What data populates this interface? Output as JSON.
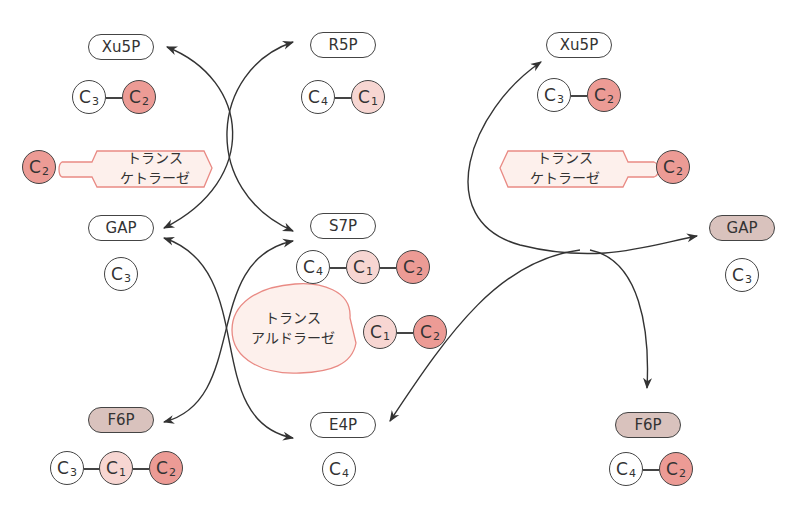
{
  "colors": {
    "line": "#333333",
    "c1_fill": "#f7d6d2",
    "c2_fill": "#ec9b95",
    "enzyme_fill": "#fdf0ec",
    "enzyme_stroke": "#e98a84",
    "shaded_pill": "#d9c2bd"
  },
  "left": {
    "xu5p": {
      "label": "Xu5P",
      "carbons": [
        {
          "c": "C",
          "n": "3"
        },
        {
          "c": "C",
          "n": "2"
        }
      ]
    },
    "r5p": {
      "label": "R5P",
      "carbons": [
        {
          "c": "C",
          "n": "4"
        },
        {
          "c": "C",
          "n": "1"
        }
      ]
    },
    "transketolase": {
      "line1": "トランス",
      "line2": "ケトラーゼ",
      "carried": {
        "c": "C",
        "n": "2"
      }
    },
    "gap": {
      "label": "GAP",
      "carbons": [
        {
          "c": "C",
          "n": "3"
        }
      ]
    },
    "s7p": {
      "label": "S7P",
      "carbons": [
        {
          "c": "C",
          "n": "4"
        },
        {
          "c": "C",
          "n": "1"
        },
        {
          "c": "C",
          "n": "2"
        }
      ]
    },
    "transaldolase": {
      "line1": "トランス",
      "line2": "アルドラーゼ",
      "carried": [
        {
          "c": "C",
          "n": "1"
        },
        {
          "c": "C",
          "n": "2"
        }
      ]
    },
    "f6p": {
      "label": "F6P",
      "carbons": [
        {
          "c": "C",
          "n": "3"
        },
        {
          "c": "C",
          "n": "1"
        },
        {
          "c": "C",
          "n": "2"
        }
      ]
    },
    "e4p": {
      "label": "E4P",
      "carbons": [
        {
          "c": "C",
          "n": "4"
        }
      ]
    }
  },
  "right": {
    "xu5p": {
      "label": "Xu5P",
      "carbons": [
        {
          "c": "C",
          "n": "3"
        },
        {
          "c": "C",
          "n": "2"
        }
      ]
    },
    "transketolase": {
      "line1": "トランス",
      "line2": "ケトラーゼ",
      "carried": {
        "c": "C",
        "n": "2"
      }
    },
    "gap": {
      "label": "GAP",
      "carbons": [
        {
          "c": "C",
          "n": "3"
        }
      ]
    },
    "f6p": {
      "label": "F6P",
      "carbons": [
        {
          "c": "C",
          "n": "4"
        },
        {
          "c": "C",
          "n": "2"
        }
      ]
    }
  }
}
